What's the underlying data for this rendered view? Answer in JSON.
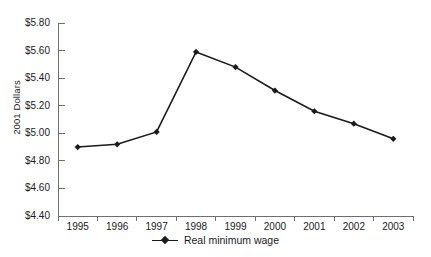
{
  "chart_data": {
    "type": "line",
    "title": "",
    "xlabel": "",
    "ylabel": "2001 Dollars",
    "categories": [
      "1995",
      "1996",
      "1997",
      "1998",
      "1999",
      "2000",
      "2001",
      "2002",
      "2003"
    ],
    "values": [
      4.9,
      4.92,
      5.01,
      5.59,
      5.48,
      5.31,
      5.16,
      5.07,
      4.96
    ],
    "series": [
      {
        "name": "Real minimum wage",
        "values": [
          4.9,
          4.92,
          5.01,
          5.59,
          5.48,
          5.31,
          5.16,
          5.07,
          4.96
        ]
      }
    ],
    "ylim": [
      4.4,
      5.8
    ],
    "ytick_step": 0.2,
    "ytick_labels": [
      "$5.80",
      "$5.60",
      "$5.40",
      "$5.20",
      "$5.00",
      "$4.80",
      "$4.60",
      "$4.40"
    ],
    "ytick_values": [
      5.8,
      5.6,
      5.4,
      5.2,
      5.0,
      4.8,
      4.6,
      4.4
    ],
    "grid": false,
    "legend_position": "bottom",
    "marker": "diamond",
    "line_color": "#1a1a1a",
    "axis_color": "#6e6e6e"
  },
  "legend": {
    "entries": [
      {
        "label": "Real minimum wage"
      }
    ]
  }
}
